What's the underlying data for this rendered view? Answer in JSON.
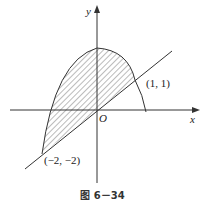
{
  "figure": {
    "caption": "图 6－34",
    "axes": {
      "x_label": "x",
      "y_label": "y",
      "origin_label": "O"
    },
    "points": [
      {
        "label": "(1, 1)",
        "x": 1,
        "y": 1
      },
      {
        "label": "(−2, −2)",
        "x": -2,
        "y": -2
      }
    ],
    "curves": [
      {
        "name": "parabola",
        "description": "downward-opening parabola with vertex on y-axis"
      },
      {
        "name": "line",
        "description": "line y = x through (−2,−2) and (1,1)"
      }
    ],
    "shaded_region": "region between parabola and line from x = −2 to x = 1 (hatched)",
    "colors": {
      "stroke": "#333333",
      "hatch": "#555555"
    }
  }
}
